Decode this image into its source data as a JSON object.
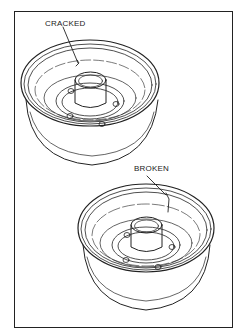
{
  "figure": {
    "labels": {
      "cracked": "CRACKED",
      "broken": "BROKEN"
    },
    "colors": {
      "line": "#222222",
      "background": "#ffffff"
    },
    "drums": [
      {
        "name": "top-drum",
        "defect": "cracked"
      },
      {
        "name": "bottom-drum",
        "defect": "broken"
      }
    ]
  }
}
